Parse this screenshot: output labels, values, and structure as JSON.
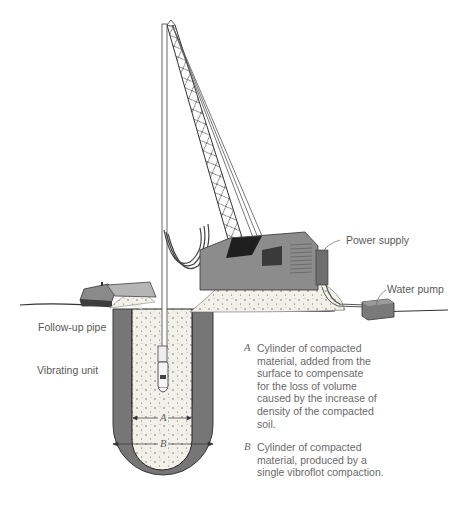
{
  "labels": {
    "power_supply": "Power supply",
    "water_pump": "Water pump",
    "follow_up_pipe": "Follow-up pipe",
    "vibrating_unit": "Vibrating unit"
  },
  "dimensions": {
    "inner": "A",
    "outer": "B"
  },
  "notes": [
    {
      "key": "A",
      "text": "Cylinder of compacted\nmaterial, added from the\nsurface to compensate\nfor the loss of volume\ncaused by the increase of\ndensity of the compacted\nsoil."
    },
    {
      "key": "B",
      "text": "Cylinder of compacted\nmaterial, produced by a\nsingle vibroflot compaction."
    }
  ],
  "colors": {
    "compacted_zone": "#767676",
    "fill_material": "#f1f1ea",
    "machine_body": "#8c8c8c",
    "machine_dark": "#3a3a3a",
    "line": "#333333"
  }
}
